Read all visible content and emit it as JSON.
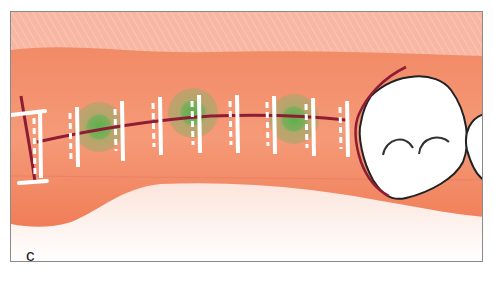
{
  "figure": {
    "panel_label": "c",
    "colors": {
      "background_tissue": "#f8b7a3",
      "gingiva": "#f28a66",
      "gingiva_dark": "#ee7a55",
      "lower_fade": "#fbe3da",
      "suture_line": "#8e1c34",
      "suture_stitch": "#ffffff",
      "graft_halo": "#9fae6a",
      "graft_core": "#5fae4e",
      "tooth_fill": "#ffffff",
      "tooth_outline": "#222222",
      "border": "#8a8a8a"
    },
    "stitches": [
      {
        "x": 23
      },
      {
        "x": 60
      },
      {
        "x": 105
      },
      {
        "x": 142
      },
      {
        "x": 181
      },
      {
        "x": 219
      },
      {
        "x": 257
      },
      {
        "x": 296
      },
      {
        "x": 331
      }
    ],
    "graft_sites": [
      {
        "x": 88,
        "y": 115
      },
      {
        "x": 182,
        "y": 101
      },
      {
        "x": 283,
        "y": 107
      }
    ]
  }
}
